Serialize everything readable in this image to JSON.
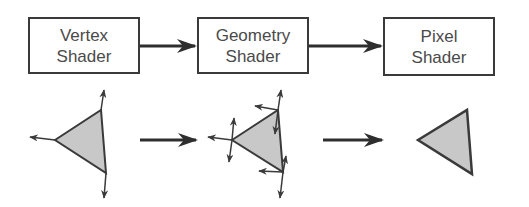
{
  "stages": [
    {
      "id": "vertex",
      "line1": "Vertex",
      "line2": "Shader"
    },
    {
      "id": "geometry",
      "line1": "Geometry",
      "line2": "Shader"
    },
    {
      "id": "pixel",
      "line1": "Pixel",
      "line2": "Shader"
    }
  ],
  "colors": {
    "stroke": "#3a3a3a",
    "triangle_fill": "#c8c8c8",
    "text": "#4a4a4a",
    "background": "#ffffff"
  }
}
